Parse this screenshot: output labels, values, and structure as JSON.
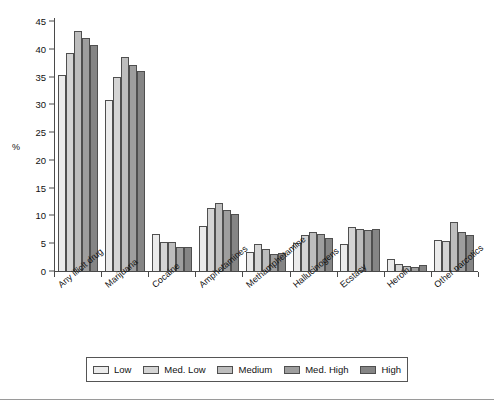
{
  "chart_data": {
    "type": "bar",
    "title": "",
    "subtitle": "",
    "xlabel": "",
    "ylabel": "%",
    "ylim": [
      0,
      45
    ],
    "ytick_step": 5,
    "yticks": [
      0,
      5,
      10,
      15,
      20,
      25,
      30,
      35,
      40,
      45
    ],
    "grid": false,
    "legend_position": "bottom",
    "orientation": "vertical",
    "grouping": "clustered",
    "categories": [
      "Any illicit drug",
      "Marijuana",
      "Cocaine",
      "Amphetamines",
      "Methamphetamine",
      "Hallucinogens",
      "Ecstasy",
      "Heroin",
      "Other narcotics"
    ],
    "series": [
      {
        "name": "Low",
        "color": "#ebebeb",
        "values": [
          35.3,
          30.8,
          6.6,
          8.1,
          3.5,
          5.0,
          4.8,
          2.1,
          5.5
        ]
      },
      {
        "name": "Med. Low",
        "color": "#d4d4d4",
        "values": [
          39.3,
          34.9,
          5.3,
          11.3,
          4.9,
          6.5,
          7.9,
          1.2,
          5.4
        ]
      },
      {
        "name": "Medium",
        "color": "#bdbdbd",
        "values": [
          43.2,
          38.5,
          5.3,
          12.2,
          3.9,
          7.0,
          7.5,
          0.9,
          8.9
        ]
      },
      {
        "name": "Med. High",
        "color": "#9e9e9e",
        "values": [
          42.0,
          37.0,
          4.3,
          11.0,
          3.0,
          6.6,
          7.3,
          0.8,
          7.0
        ]
      },
      {
        "name": "High",
        "color": "#858585",
        "values": [
          40.6,
          36.0,
          4.3,
          10.2,
          3.2,
          5.9,
          7.5,
          1.0,
          6.4
        ]
      }
    ]
  },
  "legend": {
    "items": [
      {
        "label": "Low",
        "color": "#ebebeb"
      },
      {
        "label": "Med. Low",
        "color": "#d4d4d4"
      },
      {
        "label": "Medium",
        "color": "#bdbdbd"
      },
      {
        "label": "Med. High",
        "color": "#9e9e9e"
      },
      {
        "label": "High",
        "color": "#858585"
      }
    ]
  },
  "axis": {
    "y_title": "%"
  }
}
